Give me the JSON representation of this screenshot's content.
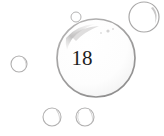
{
  "scene": {
    "title": "bubbles-illustration",
    "background_color": "#ffffff",
    "width": 164,
    "height": 136
  },
  "main_bubble": {
    "label": "18",
    "label_color": "#1d1d1d",
    "stroke_color": "#9b9a9a",
    "highlight_color": "#c9c8c8",
    "center_x": 96,
    "center_y": 58,
    "radius": 39
  },
  "bubbles": [
    {
      "name": "bubble-top-right",
      "center_x": 144,
      "center_y": 17,
      "radius": 15,
      "stroke_color": "#a9a8a8",
      "has_highlight": true
    },
    {
      "name": "bubble-top-small",
      "center_x": 76,
      "center_y": 17,
      "radius": 5,
      "stroke_color": "#b4b3b3",
      "has_highlight": false
    },
    {
      "name": "bubble-left",
      "center_x": 19,
      "center_y": 64,
      "radius": 8,
      "stroke_color": "#b0afaf",
      "has_highlight": true
    },
    {
      "name": "bubble-bottom-left",
      "center_x": 52,
      "center_y": 117,
      "radius": 9,
      "stroke_color": "#b2b1b1",
      "has_highlight": true
    },
    {
      "name": "bubble-bottom-right",
      "center_x": 85,
      "center_y": 117,
      "radius": 9,
      "stroke_color": "#b2b1b1",
      "has_highlight": true
    }
  ],
  "specks": [
    {
      "name": "speck-a",
      "x": 108,
      "y": 31,
      "r": 1.6
    },
    {
      "name": "speck-b",
      "x": 113,
      "y": 29,
      "r": 1.1
    },
    {
      "name": "speck-c",
      "x": 101,
      "y": 33,
      "r": 0.9
    }
  ]
}
